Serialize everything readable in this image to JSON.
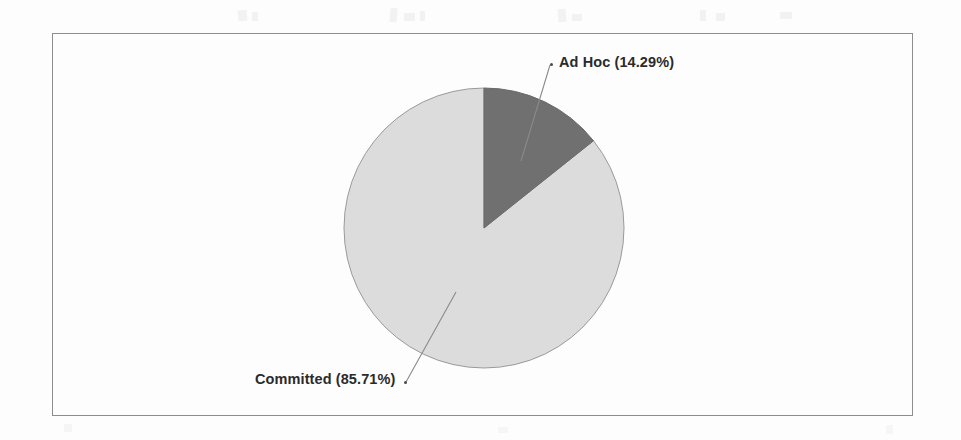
{
  "chart_data": {
    "type": "pie",
    "title": "",
    "subtitle": "",
    "xlabel": "",
    "ylabel": "",
    "grid": false,
    "legend_position": "none",
    "labels_inline": true,
    "categories": [
      "Ad Hoc",
      "Committed"
    ],
    "values": [
      14.29,
      85.71
    ],
    "units": "percent",
    "start_angle_deg": 0,
    "direction": "clockwise",
    "slices": [
      {
        "name": "Ad Hoc",
        "value": 14.29,
        "label": "Ad  Hoc (14.29%)",
        "color": "#707070",
        "angle_deg": 51.4,
        "label_position": "upper-right"
      },
      {
        "name": "Committed",
        "value": 85.71,
        "label": "Committed (85.71%)",
        "color": "#dcdcdc",
        "angle_deg": 308.6,
        "label_position": "lower-left"
      }
    ]
  },
  "labels": {
    "ad_hoc": "Ad  Hoc (14.29%)",
    "committed": "Committed (85.71%)"
  },
  "colors": {
    "ad_hoc_slice": "#707070",
    "committed_slice": "#dcdcdc",
    "slice_outline": "#9a9a9a",
    "frame_border": "#8d8d8d",
    "label_text": "#2b2b2b",
    "leader_line": "#8a8a8a",
    "background": "#fdfdfd"
  }
}
